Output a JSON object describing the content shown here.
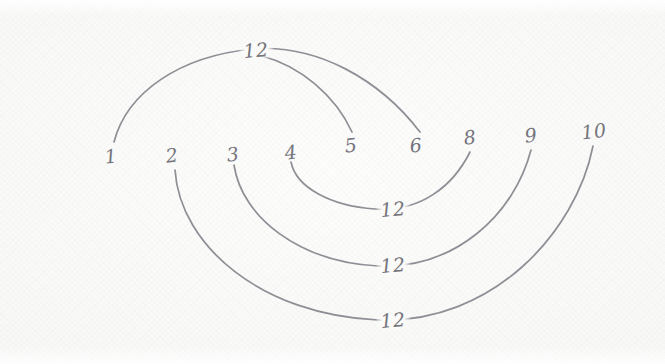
{
  "figure": {
    "medium": "pencil sketch on paper",
    "stroke_color": "#8e8e95",
    "paper_color": "#fbfbfa",
    "label_color": "#74747c"
  },
  "nodes": [
    {
      "id": "n1",
      "label": "1",
      "x": 111,
      "y": 156
    },
    {
      "id": "n2",
      "label": "2",
      "x": 172,
      "y": 155
    },
    {
      "id": "n3",
      "label": "3",
      "x": 233,
      "y": 154
    },
    {
      "id": "n4",
      "label": "4",
      "x": 291,
      "y": 152
    },
    {
      "id": "n5",
      "label": "5",
      "x": 351,
      "y": 145
    },
    {
      "id": "n6",
      "label": "6",
      "x": 416,
      "y": 145
    },
    {
      "id": "n8",
      "label": "8",
      "x": 470,
      "y": 137
    },
    {
      "id": "n9",
      "label": "9",
      "x": 531,
      "y": 135
    },
    {
      "id": "n10",
      "label": "10",
      "x": 594,
      "y": 131
    }
  ],
  "arcs": [
    {
      "id": "arc-1-6",
      "from": "1",
      "to": "6",
      "sum_label": "12",
      "direction": "above",
      "path": "M 114 142 C 127 92, 180 56, 253 49 C 318 44, 380 80, 420 132"
    },
    {
      "id": "arc-12-5",
      "from": "12",
      "to": "5",
      "sum_label": "12",
      "direction": "above",
      "path": "M 262 56 C 300 66, 335 95, 352 132"
    },
    {
      "id": "arc-4-8",
      "from": "4",
      "to": "8",
      "sum_label": "12",
      "direction": "below",
      "path": "M 291 162 C 296 187, 330 206, 375 209 C 421 212, 453 186, 470 152"
    },
    {
      "id": "arc-3-9",
      "from": "3",
      "to": "9",
      "sum_label": "12",
      "direction": "below",
      "path": "M 234 165 C 242 218, 300 262, 378 266 C 455 269, 514 215, 531 150"
    },
    {
      "id": "arc-2-10",
      "from": "2",
      "to": "10",
      "sum_label": "12",
      "direction": "below",
      "path": "M 175 170 C 180 246, 262 315, 378 320 C 493 324, 576 232, 593 146"
    }
  ],
  "sum_labels": [
    {
      "id": "sum-top",
      "text": "12",
      "x": 256,
      "y": 50,
      "note": "apex of arc 1-6 / start of arc 12-5"
    },
    {
      "id": "sum-mid-1",
      "text": "12",
      "x": 393,
      "y": 209,
      "note": "nadir of arc 4-8"
    },
    {
      "id": "sum-mid-2",
      "text": "12",
      "x": 393,
      "y": 265,
      "note": "nadir of arc 3-9"
    },
    {
      "id": "sum-bottom",
      "text": "12",
      "x": 393,
      "y": 320,
      "note": "nadir of arc 2-10"
    }
  ],
  "chart_data": {
    "type": "diagram",
    "axis_labels": [
      "1",
      "2",
      "3",
      "4",
      "5",
      "6",
      "8",
      "9",
      "10"
    ],
    "annotation_value": "12",
    "pairs": [
      {
        "left": "1",
        "right": "6",
        "label": "12"
      },
      {
        "left": "12",
        "right": "5",
        "label": "12"
      },
      {
        "left": "4",
        "right": "8",
        "label": "12"
      },
      {
        "left": "3",
        "right": "9",
        "label": "12"
      },
      {
        "left": "2",
        "right": "10",
        "label": "12"
      }
    ]
  }
}
